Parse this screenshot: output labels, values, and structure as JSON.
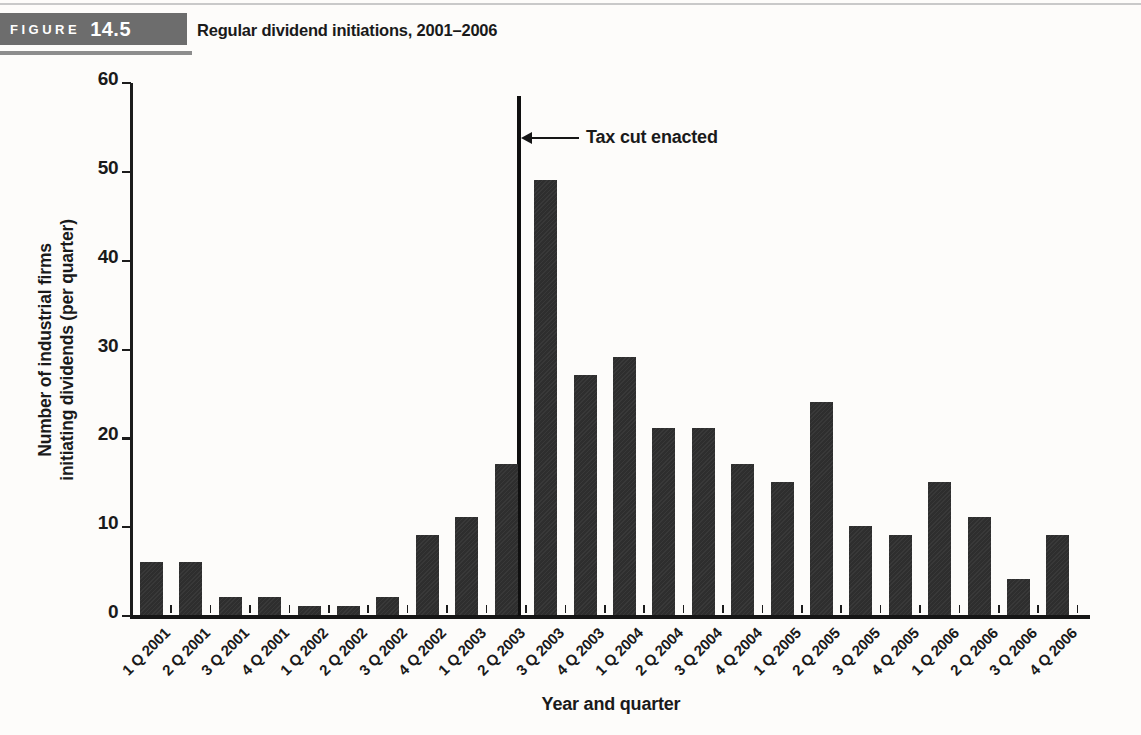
{
  "figure_header": {
    "label": "FIGURE",
    "number": "14.5",
    "title": "Regular dividend initiations, 2001–2006"
  },
  "chart_data": {
    "type": "bar",
    "title": "Regular dividend initiations, 2001–2006",
    "categories": [
      "1 Q 2001",
      "2 Q 2001",
      "3 Q 2001",
      "4 Q 2001",
      "1 Q 2002",
      "2 Q 2002",
      "3 Q 2002",
      "4 Q 2002",
      "1 Q 2003",
      "2 Q 2003",
      "3 Q 2003",
      "4 Q 2003",
      "1 Q 2004",
      "2 Q 2004",
      "3 Q 2004",
      "4 Q 2004",
      "1 Q 2005",
      "2 Q 2005",
      "3 Q 2005",
      "4 Q 2005",
      "1 Q 2006",
      "2 Q 2006",
      "3 Q 2006",
      "4 Q 2006"
    ],
    "values": [
      6,
      6,
      2,
      2,
      1,
      1,
      2,
      9,
      11,
      17,
      49,
      27,
      29,
      21,
      21,
      17,
      15,
      24,
      10,
      9,
      15,
      11,
      4,
      9
    ],
    "xlabel": "Year and quarter",
    "ylabel_line1": "Number of industrial firms",
    "ylabel_line2": "initiating dividends (per quarter)",
    "ylim": [
      0,
      60
    ],
    "yticks": [
      0,
      10,
      20,
      30,
      40,
      50,
      60
    ],
    "grid": "off",
    "legend": "none",
    "bar_color": "#2e2e2e",
    "annotation": {
      "text": "Tax cut enacted",
      "line_between": [
        "2 Q 2003",
        "3 Q 2003"
      ],
      "line_top_value": 58.5
    }
  }
}
